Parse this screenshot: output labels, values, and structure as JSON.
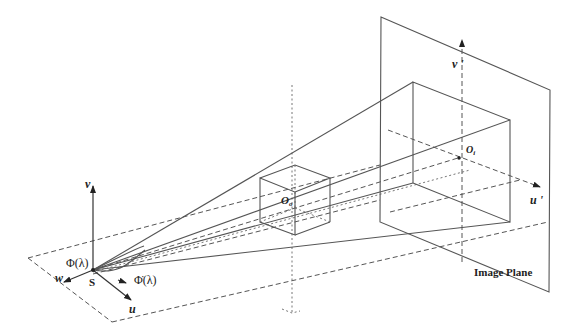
{
  "diagram": {
    "title_label": "Image Plane",
    "labels": {
      "v": "v",
      "w": "w",
      "u": "u",
      "s": "S",
      "phi": "Φ(λ)",
      "phi_dot": "Φ̇(λ)",
      "o_object": "O",
      "o_object_sub": "o",
      "o_image": "O",
      "o_image_sub": "i",
      "v_prime": "v '",
      "u_prime": "u '"
    },
    "colors": {
      "line": "#555555",
      "text": "#222222",
      "background": "#ffffff"
    }
  }
}
